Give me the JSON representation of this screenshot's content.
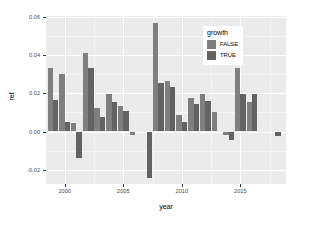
{
  "chart_data": {
    "type": "bar",
    "title": "",
    "xlabel": "year",
    "ylabel": "ret",
    "xlim": [
      1998.4,
      2018.9
    ],
    "ylim": [
      -0.0275,
      0.0605
    ],
    "grid": true,
    "legend": {
      "title": "growth",
      "position": "top-right-inside",
      "entries": [
        {
          "label": "FALSE",
          "color": "#7f7f7f"
        },
        {
          "label": "TRUE",
          "color": "#636363"
        }
      ]
    },
    "y_ticks": [
      {
        "value": 0.06,
        "label": "0.06"
      },
      {
        "value": 0.04,
        "label": "0.04"
      },
      {
        "value": 0.02,
        "label": "0.02"
      },
      {
        "value": 0.0,
        "label": "0.00"
      },
      {
        "value": -0.02,
        "label": "-0.02"
      }
    ],
    "x_ticks": [
      {
        "value": 2000,
        "label": "2000"
      },
      {
        "value": 2005,
        "label": "2005"
      },
      {
        "value": 2010,
        "label": "2010"
      },
      {
        "value": 2015,
        "label": "2015"
      }
    ],
    "categories": [
      1999,
      2000,
      2001,
      2002,
      2003,
      2004,
      2005,
      2006,
      2007,
      2008,
      2009,
      2010,
      2011,
      2012,
      2013,
      2014,
      2015,
      2016,
      2017,
      2018
    ],
    "series": [
      {
        "name": "FALSE",
        "color": "#7f7f7f",
        "values": [
          0.0332,
          0.0299,
          0.0046,
          0.0412,
          0.0125,
          0.0196,
          0.0134,
          -0.0016,
          0.0569,
          0.0262,
          0.0087,
          0.0175,
          0.0198,
          0.01,
          -0.0018,
          0.0331,
          0.0194,
          0.0194,
          null,
          null
        ]
      },
      {
        "name": "TRUE",
        "color": "#636363",
        "values": [
          0.0164,
          0.0048,
          -0.0137,
          0.0331,
          0.0075,
          0.0157,
          0.0106,
          -0.0243,
          0.0254,
          0.0231,
          0.005,
          0.0142,
          0.0158,
          -0.0046,
          0.0157,
          0.0157,
          -0.0023,
          null,
          null,
          null
        ]
      }
    ],
    "bars": [
      {
        "year": 1999,
        "growth": "FALSE",
        "value": 0.0332
      },
      {
        "year": 1999,
        "growth": "TRUE",
        "value": 0.0164
      },
      {
        "year": 2000,
        "growth": "FALSE",
        "value": 0.0299
      },
      {
        "year": 2000,
        "growth": "TRUE",
        "value": 0.0048
      },
      {
        "year": 2001,
        "growth": "FALSE",
        "value": 0.0046
      },
      {
        "year": 2001,
        "growth": "TRUE",
        "value": -0.0137
      },
      {
        "year": 2002,
        "growth": "FALSE",
        "value": 0.0412
      },
      {
        "year": 2002,
        "growth": "TRUE",
        "value": 0.0331
      },
      {
        "year": 2003,
        "growth": "FALSE",
        "value": 0.0125
      },
      {
        "year": 2003,
        "growth": "TRUE",
        "value": 0.0075
      },
      {
        "year": 2004,
        "growth": "FALSE",
        "value": 0.0196
      },
      {
        "year": 2004,
        "growth": "TRUE",
        "value": 0.0157
      },
      {
        "year": 2005,
        "growth": "FALSE",
        "value": 0.0134
      },
      {
        "year": 2005,
        "growth": "TRUE",
        "value": 0.0106
      },
      {
        "year": 2006,
        "growth": "FALSE",
        "value": -0.0016
      },
      {
        "year": 2007,
        "growth": "TRUE",
        "value": -0.0243
      },
      {
        "year": 2008,
        "growth": "FALSE",
        "value": 0.0569
      },
      {
        "year": 2008,
        "growth": "TRUE",
        "value": 0.0254
      },
      {
        "year": 2009,
        "growth": "FALSE",
        "value": 0.0262
      },
      {
        "year": 2009,
        "growth": "TRUE",
        "value": 0.0231
      },
      {
        "year": 2010,
        "growth": "FALSE",
        "value": 0.0087
      },
      {
        "year": 2010,
        "growth": "TRUE",
        "value": 0.005
      },
      {
        "year": 2011,
        "growth": "FALSE",
        "value": 0.0175
      },
      {
        "year": 2011,
        "growth": "TRUE",
        "value": 0.0142
      },
      {
        "year": 2012,
        "growth": "FALSE",
        "value": 0.0198
      },
      {
        "year": 2012,
        "growth": "TRUE",
        "value": 0.0158
      },
      {
        "year": 2013,
        "growth": "FALSE",
        "value": 0.01
      },
      {
        "year": 2014,
        "growth": "FALSE",
        "value": -0.0018
      },
      {
        "year": 2014,
        "growth": "TRUE",
        "value": -0.0046
      },
      {
        "year": 2015,
        "growth": "FALSE",
        "value": 0.0331
      },
      {
        "year": 2015,
        "growth": "TRUE",
        "value": 0.0194
      },
      {
        "year": 2016,
        "growth": "FALSE",
        "value": 0.0157
      },
      {
        "year": 2016,
        "growth": "TRUE",
        "value": 0.0194
      },
      {
        "year": 2018,
        "growth": "TRUE",
        "value": -0.0023
      }
    ]
  },
  "style": {
    "panel_bg": "#ebebeb",
    "grid_major": "#ffffff",
    "grid_minor": "#f5f5f5",
    "text_color": "#4d4d4d",
    "title_color": "#000000",
    "legend_bg": "#ffffff"
  }
}
